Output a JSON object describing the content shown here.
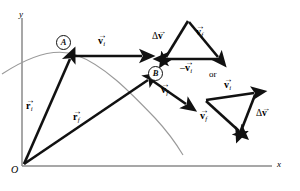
{
  "figure": {
    "axes": {
      "y_label": "y",
      "x_label": "x",
      "origin_label": "O",
      "axis_color": "#8a8a8a"
    },
    "trajectory": {
      "label": "",
      "color": "#9a9a9a"
    },
    "points": [
      {
        "id": "A",
        "label": "A"
      },
      {
        "id": "B",
        "label": "B"
      }
    ],
    "main_vectors": [
      {
        "name": "r_i",
        "symbol": "r",
        "sub": "i",
        "arrow": "→"
      },
      {
        "name": "r_f",
        "symbol": "r",
        "sub": "f",
        "arrow": "→"
      },
      {
        "name": "v_i",
        "symbol": "v",
        "sub": "i",
        "arrow": "→"
      },
      {
        "name": "v_f",
        "symbol": "v",
        "sub": "f",
        "arrow": "→"
      }
    ],
    "connector_text": "or",
    "triangle_top": {
      "labels": [
        {
          "name": "delta-v",
          "prefix": "Δ",
          "symbol": "v",
          "sub": "",
          "arrow": "→"
        },
        {
          "name": "v-f",
          "prefix": "",
          "symbol": "v",
          "sub": "f",
          "arrow": "→"
        },
        {
          "name": "minus-v-i",
          "prefix": "–",
          "symbol": "v",
          "sub": "i",
          "arrow": "→"
        }
      ]
    },
    "triangle_bottom": {
      "labels": [
        {
          "name": "v-i",
          "prefix": "",
          "symbol": "v",
          "sub": "i",
          "arrow": "→"
        },
        {
          "name": "v-f",
          "prefix": "",
          "symbol": "v",
          "sub": "f",
          "arrow": "→"
        },
        {
          "name": "delta-v",
          "prefix": "Δ",
          "symbol": "v",
          "sub": "",
          "arrow": "→"
        }
      ]
    },
    "colors": {
      "vector_black": "#111111",
      "axis_gray": "#8a8a8a",
      "curve_gray": "#9a9a9a"
    }
  }
}
